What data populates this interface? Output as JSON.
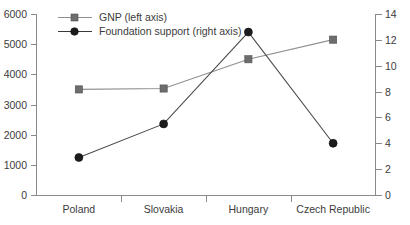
{
  "chart_data": {
    "type": "line",
    "title": "",
    "subtitle": "",
    "xlabel": "",
    "ylabel": "",
    "categories": [
      "Poland",
      "Slovakia",
      "Hungary",
      "Czech Republic"
    ],
    "series": [
      {
        "name": "GNP (left axis)",
        "axis": "left",
        "marker": "square",
        "color": "#6d6d6d",
        "values": [
          3500,
          3530,
          4500,
          5150
        ]
      },
      {
        "name": "Foundation support (right axis)",
        "axis": "right",
        "marker": "circle",
        "color": "#1c1c1c",
        "values": [
          2.9,
          5.5,
          12.6,
          4.0
        ]
      }
    ],
    "left_axis": {
      "label": "",
      "ylim": [
        0,
        6000
      ],
      "ticks": [
        0,
        1000,
        2000,
        3000,
        4000,
        5000,
        6000
      ],
      "tick_labels": [
        "0",
        "1000",
        "2000",
        "3000",
        "4000",
        "5000",
        "6000"
      ]
    },
    "right_axis": {
      "label": "",
      "ylim": [
        0,
        14
      ],
      "ticks": [
        0,
        2,
        4,
        6,
        8,
        10,
        12,
        14
      ],
      "tick_labels": [
        "0",
        "2",
        "4",
        "6",
        "8",
        "10",
        "12",
        "14"
      ]
    },
    "grid": false,
    "legend_position": "top-left",
    "legend": [
      {
        "label": "GNP (left axis)",
        "marker": "square"
      },
      {
        "label": "Foundation support (right axis)",
        "marker": "circle"
      }
    ],
    "colors": {
      "gnp_line": "#8f8f8f",
      "gnp_marker": "#6d6d6d",
      "foundation_line": "#4a4a4a",
      "foundation_marker": "#1c1c1c",
      "axis": "#8a8a8a",
      "text": "#3b3b3b",
      "background": "#ffffff"
    }
  }
}
